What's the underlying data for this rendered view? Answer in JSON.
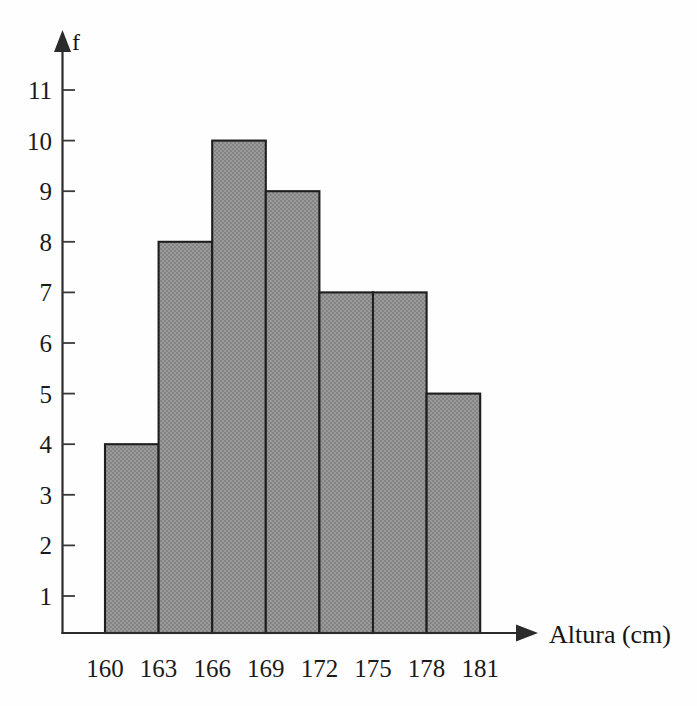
{
  "figure": {
    "name": "histogram-altura",
    "background_color": "#ffffff",
    "bar_fill_color": "#8f8f8f",
    "bar_stroke_color": "#1e1e1e",
    "axis_color": "#2b2b2b"
  },
  "chart_data": {
    "type": "bar",
    "title": "",
    "subtitle": "",
    "xlabel": "Altura (cm)",
    "ylabel": "f",
    "grid": false,
    "legend": null,
    "bin_edges": [
      160,
      163,
      166,
      169,
      172,
      175,
      178,
      181
    ],
    "categories": [
      "160-163",
      "163-166",
      "166-169",
      "169-172",
      "172-175",
      "175-178",
      "178-181"
    ],
    "values": [
      4,
      8,
      10,
      9,
      7,
      7,
      5
    ],
    "xtick_labels": [
      "160",
      "163",
      "166",
      "169",
      "172",
      "175",
      "178",
      "181"
    ],
    "ytick_labels": [
      "1",
      "2",
      "3",
      "4",
      "5",
      "6",
      "7",
      "8",
      "9",
      "10",
      "11"
    ],
    "ytick_values": [
      1,
      2,
      3,
      4,
      5,
      6,
      7,
      8,
      9,
      10,
      11
    ],
    "xlim": [
      160,
      181
    ],
    "ylim": [
      0,
      11.8
    ],
    "bar_width_units": 3,
    "x_axis_has_arrow": true,
    "y_axis_has_arrow": true
  },
  "axis_titles": {
    "x": "Altura (cm)",
    "y": "f"
  }
}
